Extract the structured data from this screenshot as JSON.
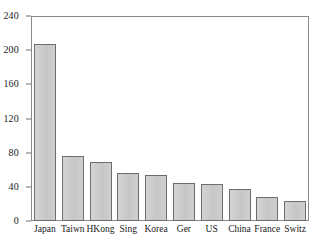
{
  "chart_data": {
    "type": "bar",
    "title": "",
    "xlabel": "",
    "ylabel": "",
    "categories": [
      "Japan",
      "Taiwn",
      "HKong",
      "Sing",
      "Korea",
      "Ger",
      "US",
      "China",
      "France",
      "Switz"
    ],
    "values": [
      207,
      76,
      69,
      56,
      54,
      45,
      43,
      37,
      28,
      23
    ],
    "ylim": [
      0,
      240
    ],
    "yticks": [
      0,
      40,
      80,
      120,
      160,
      200,
      240
    ],
    "ytick_labels": [
      "0",
      "40",
      "80",
      "120",
      "160",
      "200",
      "240"
    ],
    "grid": false,
    "legend": null,
    "bar_fill_color": "#c9c9c9",
    "bar_edge_color": "#6d6d6d",
    "frame_color": "#8a8a8a",
    "text_color": "#1a1a1a"
  }
}
